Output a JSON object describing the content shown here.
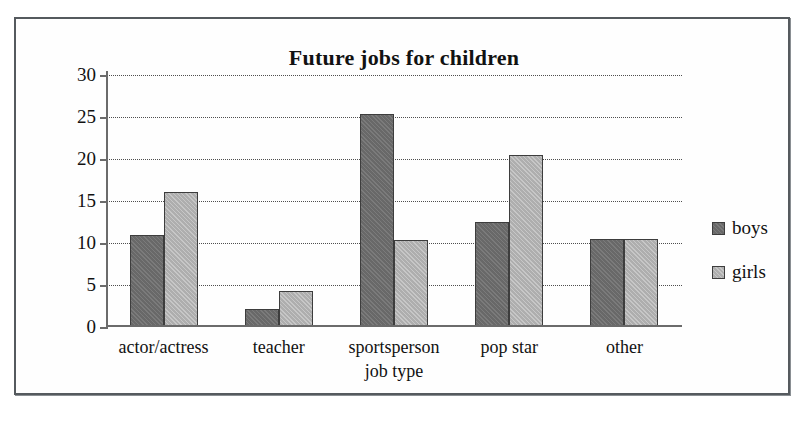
{
  "chart_data": {
    "type": "bar",
    "title": "Future jobs for children",
    "xlabel": "job type",
    "ylabel": "number of children",
    "categories": [
      "actor/actress",
      "teacher",
      "sportsperson",
      "pop star",
      "other"
    ],
    "series": [
      {
        "name": "boys",
        "color": "#6e6e6e",
        "values": [
          11,
          2.2,
          25.4,
          12.5,
          10.5
        ]
      },
      {
        "name": "girls",
        "color": "#b7b7b7",
        "values": [
          16.1,
          4.3,
          10.3,
          20.5,
          10.5
        ]
      }
    ],
    "ylim": [
      0,
      30
    ],
    "yticks": [
      0,
      5,
      10,
      15,
      20,
      25,
      30
    ],
    "ytick_labels": [
      "0",
      "5",
      "10",
      "15",
      "20",
      "25",
      "30"
    ],
    "grid": true,
    "grid_style": "dotted-horizontal",
    "legend_position": "right"
  },
  "legend": {
    "entries": [
      {
        "label": "boys"
      },
      {
        "label": "girls"
      }
    ]
  }
}
